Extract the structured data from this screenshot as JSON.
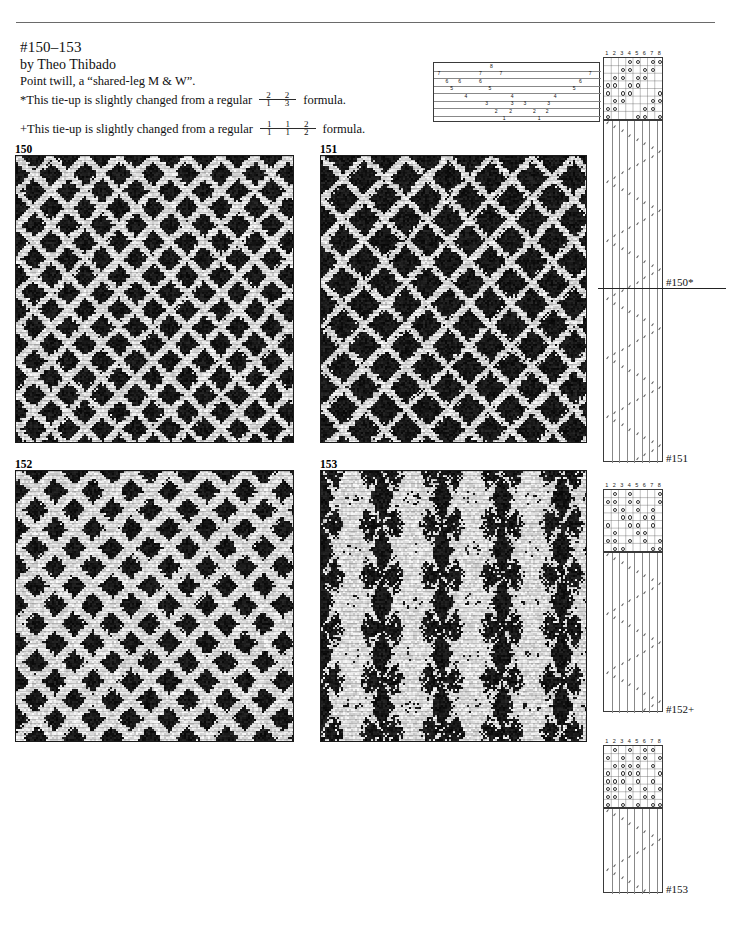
{
  "document": {
    "kind": "weaving-draft-page",
    "page_background": "#ffffff",
    "ink_color": "#111111"
  },
  "header": {
    "title": "#150–153",
    "author": "by Theo Thibado",
    "description": "Point twill, a “shared-leg M & W”.",
    "notes": [
      {
        "marker": "*",
        "text_before": "*This tie-up is slightly changed from a regular",
        "text_after": "formula.",
        "fractions": [
          {
            "num": "2",
            "den": "1"
          },
          {
            "num": "2",
            "den": "3"
          }
        ]
      },
      {
        "marker": "+",
        "text_before": "+This tie-up is slightly changed from a regular",
        "text_after": "formula.",
        "fractions": [
          {
            "num": "1",
            "den": "1"
          },
          {
            "num": "1",
            "den": "1"
          },
          {
            "num": "2",
            "den": "2"
          }
        ]
      }
    ]
  },
  "swatches": [
    {
      "label": "150",
      "x": 15,
      "y": 155,
      "w": 279,
      "h": 288,
      "pattern": "diamond-point-twill",
      "dominant": "dark"
    },
    {
      "label": "151",
      "x": 320,
      "y": 155,
      "w": 267,
      "h": 288,
      "pattern": "diamond-point-twill-bold",
      "dominant": "dark"
    },
    {
      "label": "152",
      "x": 15,
      "y": 470,
      "w": 279,
      "h": 272,
      "pattern": "medallion-twill",
      "dominant": "mid"
    },
    {
      "label": "153",
      "x": 320,
      "y": 470,
      "w": 267,
      "h": 272,
      "pattern": "vertical-stripe-twill",
      "dominant": "dark"
    }
  ],
  "swatch_labels": [
    {
      "text": "150",
      "x": 15,
      "y": 143
    },
    {
      "text": "151",
      "x": 320,
      "y": 143
    },
    {
      "text": "152",
      "x": 15,
      "y": 458
    },
    {
      "text": "153",
      "x": 320,
      "y": 458
    }
  ],
  "drafts": [
    {
      "id": "draft-150-151",
      "tieup_label": "#150*",
      "treadling_label": "#151",
      "threading": {
        "x": 433,
        "y": 62,
        "w": 167,
        "h": 60,
        "shafts": 8,
        "marks": [
          {
            "shaft": 8,
            "positions": [
              0.34
            ]
          },
          {
            "shaft": 7,
            "positions": [
              0.01,
              0.27,
              0.4,
              0.96
            ]
          },
          {
            "shaft": 6,
            "positions": [
              0.06,
              0.14,
              0.27,
              0.9
            ]
          },
          {
            "shaft": 5,
            "positions": [
              0.09,
              0.33,
              0.86
            ]
          },
          {
            "shaft": 4,
            "positions": [
              0.18,
              0.47,
              0.74
            ]
          },
          {
            "shaft": 3,
            "positions": [
              0.31,
              0.47,
              0.55,
              0.7
            ]
          },
          {
            "shaft": 2,
            "positions": [
              0.37,
              0.46,
              0.61,
              0.69
            ]
          },
          {
            "shaft": 1,
            "positions": [
              0.42,
              0.64
            ]
          }
        ]
      },
      "tieup": {
        "x": 603,
        "y": 57,
        "w": 60,
        "h": 63,
        "cols": 8,
        "rows": 8,
        "col_headers": [
          "1",
          "2",
          "3",
          "4",
          "5",
          "6",
          "7",
          "8"
        ],
        "cells": [
          [
            0,
            0,
            0,
            1,
            1,
            0,
            1,
            1
          ],
          [
            0,
            0,
            1,
            1,
            0,
            1,
            1,
            0
          ],
          [
            0,
            1,
            1,
            0,
            1,
            1,
            0,
            0
          ],
          [
            1,
            1,
            0,
            1,
            1,
            0,
            0,
            0
          ],
          [
            1,
            0,
            1,
            1,
            0,
            0,
            0,
            1
          ],
          [
            0,
            1,
            1,
            0,
            0,
            0,
            1,
            1
          ],
          [
            1,
            1,
            0,
            0,
            0,
            1,
            1,
            0
          ],
          [
            1,
            0,
            0,
            0,
            1,
            1,
            0,
            1
          ]
        ]
      },
      "treadling": {
        "x": 603,
        "y": 120,
        "w": 60,
        "h": 342,
        "columns": 8,
        "pattern": "point-zigzag"
      },
      "separator_y": 288
    },
    {
      "id": "draft-152",
      "tieup_label": "#152+",
      "tieup": {
        "x": 603,
        "y": 489,
        "w": 60,
        "h": 63,
        "cols": 8,
        "rows": 8,
        "col_headers": [
          "1",
          "2",
          "3",
          "4",
          "5",
          "6",
          "7",
          "8"
        ],
        "cells": [
          [
            0,
            1,
            0,
            1,
            0,
            0,
            0,
            1
          ],
          [
            1,
            1,
            0,
            1,
            1,
            0,
            0,
            1
          ],
          [
            0,
            1,
            1,
            0,
            1,
            0,
            1,
            0
          ],
          [
            0,
            0,
            1,
            1,
            0,
            1,
            1,
            0
          ],
          [
            1,
            0,
            0,
            1,
            1,
            0,
            1,
            0
          ],
          [
            0,
            1,
            0,
            0,
            1,
            1,
            0,
            0
          ],
          [
            1,
            1,
            0,
            1,
            0,
            1,
            0,
            1
          ],
          [
            0,
            1,
            1,
            0,
            0,
            0,
            1,
            1
          ]
        ]
      },
      "treadling": {
        "x": 603,
        "y": 552,
        "w": 60,
        "h": 160,
        "columns": 8,
        "pattern": "point-zigzag"
      }
    },
    {
      "id": "draft-153",
      "tieup_label": "#153",
      "tieup": {
        "x": 603,
        "y": 745,
        "w": 60,
        "h": 63,
        "cols": 8,
        "rows": 8,
        "col_headers": [
          "1",
          "2",
          "3",
          "4",
          "5",
          "6",
          "7",
          "8"
        ],
        "cells": [
          [
            0,
            1,
            0,
            1,
            0,
            1,
            1,
            0
          ],
          [
            1,
            0,
            1,
            0,
            1,
            1,
            0,
            1
          ],
          [
            0,
            1,
            1,
            1,
            1,
            0,
            1,
            0
          ],
          [
            1,
            0,
            1,
            1,
            1,
            0,
            0,
            1
          ],
          [
            1,
            1,
            1,
            0,
            1,
            0,
            1,
            0
          ],
          [
            1,
            1,
            0,
            1,
            0,
            1,
            0,
            1
          ],
          [
            1,
            1,
            0,
            1,
            0,
            1,
            1,
            0
          ],
          [
            1,
            0,
            1,
            0,
            1,
            0,
            1,
            1
          ]
        ]
      },
      "treadling": {
        "x": 603,
        "y": 808,
        "w": 60,
        "h": 85,
        "columns": 8,
        "pattern": "point-zigzag"
      }
    }
  ],
  "draft_labels": [
    {
      "text": "#150*",
      "x": 666,
      "y": 276
    },
    {
      "text": "#151",
      "x": 666,
      "y": 452
    },
    {
      "text": "#152+",
      "x": 666,
      "y": 703
    },
    {
      "text": "#153",
      "x": 666,
      "y": 883
    }
  ]
}
